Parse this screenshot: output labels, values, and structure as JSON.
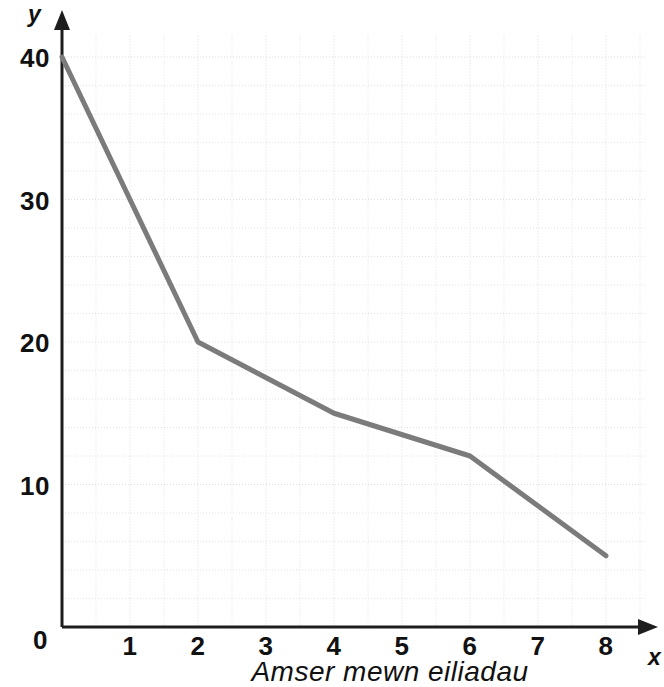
{
  "chart_data": {
    "type": "line",
    "title": "",
    "xlabel": "Amser mewn eiliadau",
    "ylabel": "",
    "x_axis_symbol": "x",
    "y_axis_symbol": "y",
    "x": [
      0,
      2,
      4,
      6,
      8
    ],
    "values": [
      40,
      20,
      15,
      12,
      5
    ],
    "series": [
      {
        "name": "y",
        "points": [
          {
            "x": 0,
            "y": 40
          },
          {
            "x": 2,
            "y": 20
          },
          {
            "x": 4,
            "y": 15
          },
          {
            "x": 6,
            "y": 12
          },
          {
            "x": 8,
            "y": 5
          }
        ]
      }
    ],
    "xlim": [
      0,
      8.6
    ],
    "ylim": [
      0,
      41.5
    ],
    "xticks": [
      0,
      1,
      2,
      3,
      4,
      5,
      6,
      7,
      8
    ],
    "xtick_labels": [
      "0",
      "1",
      "2",
      "3",
      "4",
      "5",
      "6",
      "7",
      "8"
    ],
    "yticks": [
      0,
      10,
      20,
      30,
      40
    ],
    "ytick_labels": [
      "0",
      "10",
      "20",
      "30",
      "40"
    ],
    "grid": true,
    "grid_x_step": 0.5,
    "grid_y_step": 2,
    "legend": false,
    "line_color": "#7b7b7b",
    "axis_color": "#1d1d1d",
    "grid_color": "#e2e2ea",
    "background_color": "#ffffff"
  },
  "axis": {
    "origin_label": "0",
    "x_symbol": "x",
    "y_symbol": "y",
    "x_title": "Amser mewn eiliadau"
  }
}
